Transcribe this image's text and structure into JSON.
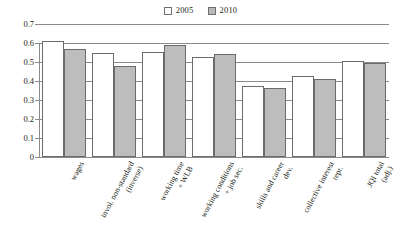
{
  "chart_data": {
    "type": "bar",
    "title": "",
    "subtitle": "",
    "xlabel": "",
    "ylabel": "",
    "ylim": [
      0,
      0.7
    ],
    "ytick_labels": [
      "0.7",
      "0.6",
      "0.5",
      "0.4",
      "0.3",
      "0.2",
      "0.1",
      "0"
    ],
    "ytick_values": [
      0.7,
      0.6,
      0.5,
      0.4,
      0.3,
      0.2,
      0.1,
      0
    ],
    "grid": "horizontal",
    "legend_position": "top-center",
    "categories": [
      "wages",
      "invol. non-standard (inverse)",
      "working time + WLB",
      "working conditions + job sec.",
      "skills and career dev.",
      "collective interest repr.",
      "JQI total (adj.)"
    ],
    "category_lines": [
      [
        "wages"
      ],
      [
        "invol. non-standard",
        "(inverse)"
      ],
      [
        "working time",
        "+ WLB"
      ],
      [
        "working conditions",
        "+ job sec."
      ],
      [
        "skills and career",
        "dev."
      ],
      [
        "collective interest",
        "repr."
      ],
      [
        "JQI total",
        "(adj.)"
      ]
    ],
    "series": [
      {
        "name": "2005",
        "color": "#ffffff",
        "values": [
          0.61,
          0.545,
          0.555,
          0.525,
          0.375,
          0.425,
          0.505
        ]
      },
      {
        "name": "2010",
        "color": "#bdbdbd",
        "values": [
          0.57,
          0.48,
          0.59,
          0.54,
          0.365,
          0.41,
          0.495
        ]
      }
    ]
  },
  "legend": {
    "entries": [
      {
        "label": "2005",
        "swatch": "legend-swatch-2005"
      },
      {
        "label": "2010",
        "swatch": "legend-swatch-2010"
      }
    ]
  },
  "colors": {
    "series_2005": "#ffffff",
    "series_2010": "#bdbdbd",
    "axis": "#8a8a8a",
    "bar_outline": "#6b6b6b",
    "text": "#231f20",
    "background": "#ffffff"
  }
}
